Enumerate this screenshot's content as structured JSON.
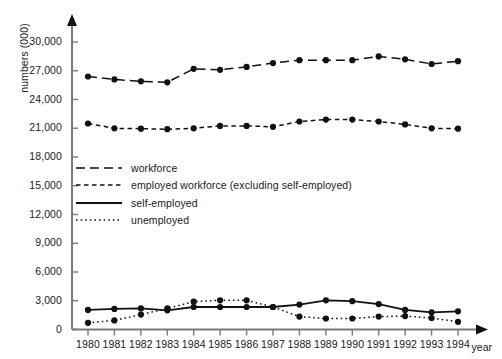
{
  "chart_data": {
    "type": "line",
    "title": "",
    "xlabel": "year",
    "ylabel": "numbers (000)",
    "ylim": [
      0,
      30000
    ],
    "yticks": [
      "0",
      "3,000",
      "6,000",
      "9,000",
      "12,000",
      "15,000",
      "18,000",
      "21,000",
      "24,000",
      "27,000",
      "30,000"
    ],
    "ytick_values": [
      0,
      3000,
      6000,
      9000,
      12000,
      15000,
      18000,
      21000,
      24000,
      27000,
      30000
    ],
    "grid": false,
    "legend_position": "inside-left",
    "categories": [
      "1980",
      "1981",
      "1982",
      "1983",
      "1984",
      "1985",
      "1986",
      "1987",
      "1988",
      "1989",
      "1990",
      "1991",
      "1992",
      "1993",
      "1994"
    ],
    "x": [
      1980,
      1981,
      1982,
      1983,
      1984,
      1985,
      1986,
      1987,
      1988,
      1989,
      1990,
      1991,
      1992,
      1993,
      1994
    ],
    "series": [
      {
        "name": "workforce",
        "style": "dashed",
        "marker": "filled-circle",
        "color": "#111111",
        "values": [
          26400,
          26100,
          25900,
          25800,
          27200,
          27100,
          27400,
          27800,
          28100,
          28100,
          28100,
          28500,
          28200,
          27700,
          28000
        ]
      },
      {
        "name": "employed workforce (excluding self-employed)",
        "style": "short-dashed",
        "marker": "filled-circle",
        "color": "#111111",
        "values": [
          21500,
          21000,
          20950,
          20900,
          21000,
          21250,
          21250,
          21150,
          21700,
          21900,
          21900,
          21700,
          21400,
          21000,
          20950
        ]
      },
      {
        "name": "self-employed",
        "style": "solid",
        "marker": "filled-circle",
        "color": "#111111",
        "values": [
          2050,
          2150,
          2200,
          2000,
          2350,
          2350,
          2350,
          2350,
          2600,
          3050,
          2950,
          2650,
          2050,
          1800,
          1900
        ]
      },
      {
        "name": "unemployed",
        "style": "dotted",
        "marker": "filled-circle",
        "color": "#111111",
        "values": [
          700,
          950,
          1550,
          2200,
          2900,
          3050,
          3050,
          2350,
          1350,
          1150,
          1150,
          1350,
          1400,
          1200,
          800
        ]
      }
    ]
  },
  "axis": {
    "y_arrow": true,
    "x_arrow": true,
    "axis_color": "#7a7a7a",
    "ink_color": "#111111"
  }
}
